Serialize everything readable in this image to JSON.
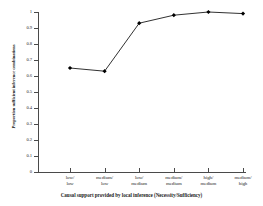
{
  "chart_data": {
    "type": "line",
    "title": "",
    "xlabel": "Causal support provided by local inference (Necessity/Sufficiency)",
    "ylabel": "Proportion sufficient inference combinations",
    "categories": [
      "low/low",
      "medium/ low",
      "low/ medium",
      "medium/ medium",
      "high/ medium",
      "medium/ high"
    ],
    "values": [
      0.65,
      0.63,
      0.93,
      0.98,
      1.0,
      0.99
    ],
    "ylim": [
      0,
      1
    ],
    "ytick_labels": [
      "0",
      "0.1",
      "0.2",
      "0.3",
      "0.4",
      "0.5",
      "0.6",
      "0.7",
      "0.8",
      "0.9",
      "1"
    ],
    "ytick_values": [
      0,
      0.1,
      0.2,
      0.3,
      0.4,
      0.5,
      0.6,
      0.7,
      0.8,
      0.9,
      1
    ],
    "grid": false,
    "legend": false,
    "marker": "filled-diamond",
    "line_color": "#1a1a1a",
    "marker_color": "#000000",
    "axis_color": "#4a4a4a"
  }
}
